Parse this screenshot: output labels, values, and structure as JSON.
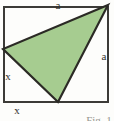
{
  "figure": {
    "caption": "Fig. 1",
    "labels": {
      "side_top": "a",
      "side_right": "a",
      "segment_left": "x",
      "segment_bottom": "x"
    },
    "colors": {
      "triangle_fill": "#a6cc90",
      "line": "#2b2a25",
      "square_stroke": "#3c3b37",
      "label_text": "#33322d",
      "caption_text": "#97968f",
      "background": "#fdfdfb"
    }
  }
}
